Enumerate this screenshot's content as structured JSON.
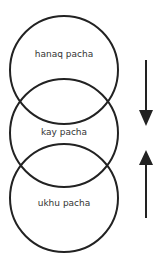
{
  "diagram": {
    "circles": [
      {
        "label": "hanaq pacha",
        "cx": 64,
        "cy": 70,
        "r": 54
      },
      {
        "label": "kay pacha",
        "cx": 64,
        "cy": 133,
        "r": 54
      },
      {
        "label": "ukhu pacha",
        "cx": 64,
        "cy": 198,
        "r": 54
      }
    ],
    "arrows": [
      {
        "direction": "down",
        "x": 146,
        "y_start": 60,
        "y_end": 126
      },
      {
        "direction": "up",
        "x": 146,
        "y_start": 218,
        "y_end": 150
      }
    ],
    "colors": {
      "stroke": "#222222",
      "text": "#333333",
      "background": "#ffffff"
    }
  }
}
